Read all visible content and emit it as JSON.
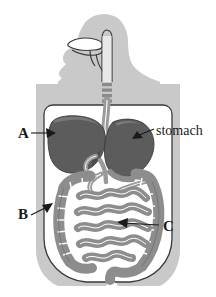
{
  "figure": {
    "background_color": "#ffffff"
  },
  "colors": {
    "body_silhouette": "#c9c9c9",
    "body_cavity": "#ffffff",
    "organ_dark": "#5c5c5c",
    "organ_dark_shade": "#6e6e6e",
    "intestine_mid": "#8d8d8d",
    "intestine_light": "#a9a9a9",
    "outline": "#3a3a3a",
    "label_text": "#1a1a1a",
    "esophagus": "#9a9a9a"
  },
  "labels": [
    {
      "id": "A",
      "text": "A",
      "kind": "letter",
      "x": 18,
      "y": 138,
      "points_to": "liver",
      "leader": {
        "x1": 31,
        "y1": 133,
        "x2": 56,
        "y2": 133
      },
      "arrow": {
        "x": 56,
        "y": 133,
        "direction": "right"
      }
    },
    {
      "id": "B",
      "text": "B",
      "kind": "letter",
      "x": 18,
      "y": 219,
      "points_to": "ascending-colon",
      "leader": {
        "x1": 31,
        "y1": 215,
        "x2": 50,
        "y2": 205
      },
      "arrow": {
        "x": 50,
        "y": 205,
        "direction": "up-right"
      }
    },
    {
      "id": "C",
      "text": "C",
      "kind": "letter",
      "x": 163,
      "y": 231,
      "points_to": "small-intestine",
      "leader": {
        "x1": 160,
        "y1": 226,
        "x2": 119,
        "y2": 222
      },
      "arrow": {
        "x": 119,
        "y": 222,
        "direction": "left"
      }
    },
    {
      "id": "stomach",
      "text": "stomach",
      "kind": "word",
      "x": 156,
      "y": 135,
      "points_to": "stomach",
      "leader": {
        "x1": 153,
        "y1": 130,
        "x2": 134,
        "y2": 138
      },
      "arrow": {
        "x": 134,
        "y": 138,
        "direction": "down-left"
      }
    }
  ],
  "organs": [
    {
      "name": "mouth-and-tongue",
      "region": "head"
    },
    {
      "name": "esophagus",
      "region": "neck-to-torso",
      "style": "dashed-segment"
    },
    {
      "name": "liver",
      "region": "upper-left-abdomen",
      "label": "A"
    },
    {
      "name": "stomach",
      "region": "upper-right-abdomen",
      "label": "stomach"
    },
    {
      "name": "large-intestine",
      "region": "abdomen-perimeter",
      "label": "B"
    },
    {
      "name": "small-intestine",
      "region": "abdomen-center",
      "label": "C"
    },
    {
      "name": "pancreas-duct",
      "region": "mid-abdomen"
    }
  ]
}
